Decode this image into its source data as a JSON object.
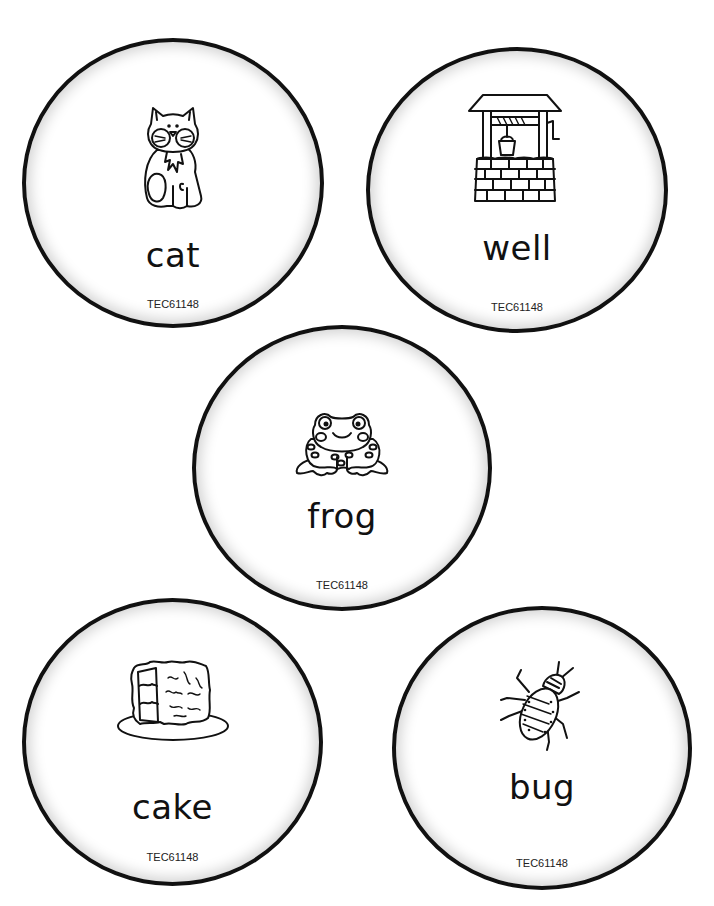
{
  "sheet": {
    "background": "#ffffff",
    "border_color": "#111111",
    "cards": [
      {
        "id": "cat",
        "word": "cat",
        "code": "TEC61148",
        "picture": "cat-icon"
      },
      {
        "id": "well",
        "word": "well",
        "code": "TEC61148",
        "picture": "wishing-well-icon"
      },
      {
        "id": "frog",
        "word": "frog",
        "code": "TEC61148",
        "picture": "frog-icon"
      },
      {
        "id": "cake",
        "word": "cake",
        "code": "TEC61148",
        "picture": "cake-icon"
      },
      {
        "id": "bug",
        "word": "bug",
        "code": "TEC61148",
        "picture": "bug-icon"
      }
    ]
  }
}
